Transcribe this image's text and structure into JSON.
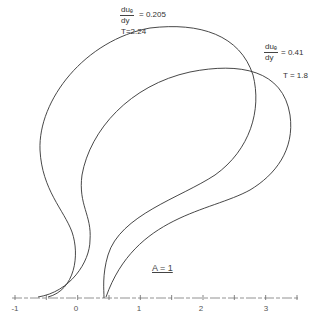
{
  "chart_data": {
    "type": "line",
    "title": "",
    "xlabel": "",
    "ylabel": "",
    "xlim": [
      -1,
      3.5
    ],
    "grid": false,
    "legend": "none",
    "x_ticks": [
      -1,
      -0.5,
      0,
      0.5,
      1,
      1.5,
      2,
      2.5,
      3,
      3.5
    ],
    "x_tick_labels": [
      "-1",
      "0",
      "1",
      "2",
      "3"
    ],
    "annotation": "A = 1",
    "series": [
      {
        "name": "T=2.24",
        "annotation": {
          "derivative": "duₑ/dy",
          "value": "0.205",
          "T": "T=2.24"
        },
        "shape": "closed-loop teardrop, left branch",
        "path": "M 48 297 C 75 290, 80 255, 72 232 C 64 210, 42 190, 40 150 C 38 100, 85 40, 150 28 C 200 22, 240 35, 253 75 C 262 110, 250 150, 215 175 C 180 198, 120 215, 108 255 C 102 275, 104 290, 104 298"
      },
      {
        "name": "T=1.8",
        "annotation": {
          "derivative": "duₑ/dy",
          "value": "0.41",
          "T": "T=1.8"
        },
        "shape": "closed-loop teardrop, right branch",
        "path": "M 38 297 C 70 292, 90 262, 90 240 C 92 215, 78 205, 82 175 C 90 130, 130 85, 190 72 C 240 62, 283 70, 290 115 C 295 150, 275 175, 250 190 C 210 212, 135 215, 106 297"
      }
    ],
    "text_labels": {
      "curve1_frac_num": "duₑ",
      "curve1_frac_den": "dy",
      "curve1_value": "= 0.205",
      "curve1_T": "T=2.24",
      "curve2_frac_num": "duₑ",
      "curve2_frac_den": "dy",
      "curve2_value": "= 0.41",
      "curve2_T": "T = 1.8",
      "a_label": "A = 1"
    },
    "tick_label_positions": [
      {
        "label": "-1",
        "px": 15
      },
      {
        "label": "0",
        "px": 76
      },
      {
        "label": "1",
        "px": 139
      },
      {
        "label": "2",
        "px": 201
      },
      {
        "label": "3",
        "px": 266
      }
    ]
  }
}
